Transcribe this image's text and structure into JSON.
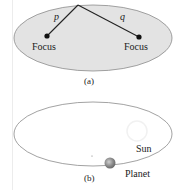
{
  "panel_a": {
    "caption": "(a)",
    "fill_color": "#e3e3e3",
    "outline_color": "#8a8a8a",
    "foci": [
      {
        "label": "Focus"
      },
      {
        "label": "Focus"
      }
    ],
    "segments": [
      {
        "label": "p"
      },
      {
        "label": "q"
      }
    ]
  },
  "panel_b": {
    "caption": "(b)",
    "outline_color": "#8a8a8a",
    "sun_label": "Sun",
    "planet_label": "Planet"
  }
}
